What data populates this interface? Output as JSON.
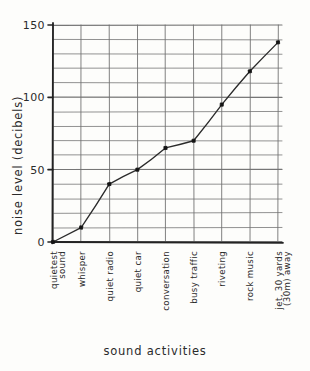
{
  "chart_data": {
    "type": "line",
    "title": "",
    "xlabel": "sound activities",
    "ylabel": "noise level (decibels)",
    "categories": [
      "quietest sound",
      "whisper",
      "quiet radio",
      "quiet car",
      "conversation",
      "busy traffic",
      "riveting",
      "rock music",
      "jet, 30 yards (30m) away"
    ],
    "category_lines": [
      [
        "quietest",
        "sound"
      ],
      [
        "whisper"
      ],
      [
        "quiet radio"
      ],
      [
        "quiet car"
      ],
      [
        "conversation"
      ],
      [
        "busy traffic"
      ],
      [
        "riveting"
      ],
      [
        "rock music"
      ],
      [
        "jet, 30 yards",
        "(30m) away"
      ]
    ],
    "values": [
      0,
      10,
      40,
      50,
      65,
      70,
      95,
      118,
      138
    ],
    "ylim": [
      0,
      150
    ],
    "ytick_labels": [
      "0",
      "50",
      "100",
      "150"
    ],
    "ytick_values": [
      0,
      50,
      100,
      150
    ],
    "y_gridline_step": 10,
    "grid": true,
    "legend": "none",
    "marker": "filled-square",
    "style": "hand-drawn"
  },
  "colors": {
    "paper": "#fdfdfb",
    "ink": "#2b2b2b",
    "gridline": "#6f6f6f",
    "axis": "#232323",
    "series": "#2b2b2b",
    "marker": "#141414"
  },
  "axes": {
    "y_axis_label": "noise level (decibels)",
    "x_axis_label": "sound activities"
  }
}
